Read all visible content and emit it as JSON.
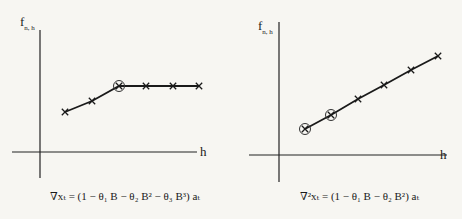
{
  "chart_data": [
    {
      "type": "line",
      "title": "",
      "caption": "∇xₜ = (1 − θ₁ B − θ₂ B² − θ₃ B³) aₜ",
      "xlabel": "h",
      "ylabel": "f_{n,h}",
      "grid": false,
      "x": [
        1,
        2,
        3,
        4,
        5,
        6
      ],
      "values": [
        1.0,
        1.4,
        2.0,
        2.0,
        2.0,
        2.0
      ],
      "markers": [
        "x",
        "x",
        "circled-x",
        "x",
        "x",
        "x"
      ],
      "px": [
        [
          65,
          112
        ],
        [
          92,
          101
        ],
        [
          119,
          86
        ],
        [
          146,
          86
        ],
        [
          173,
          86
        ],
        [
          199,
          86
        ]
      ]
    },
    {
      "type": "line",
      "title": "",
      "caption": "∇²xₜ = (1 − θ₁ B − θ₂ B²) aₜ",
      "xlabel": "h",
      "ylabel": "f_{n,h}",
      "grid": false,
      "x": [
        1,
        2,
        3,
        4,
        5,
        6
      ],
      "values": [
        1.0,
        1.55,
        2.15,
        2.7,
        3.3,
        3.85
      ],
      "markers": [
        "circled-x",
        "circled-x",
        "x",
        "x",
        "x",
        "x"
      ],
      "px": [
        [
          305,
          129
        ],
        [
          331,
          115
        ],
        [
          358,
          99
        ],
        [
          384,
          85
        ],
        [
          411,
          70
        ],
        [
          438,
          56
        ]
      ]
    }
  ],
  "labels": {
    "left": {
      "y_main": "f",
      "y_sub": "n, h",
      "x": "h",
      "caption": "∇xₜ = (1 − θ₁ B − θ₂ B² − θ₃ B³) aₜ"
    },
    "right": {
      "y_main": "f",
      "y_sub": "n, h",
      "x": "h",
      "caption": "∇²xₜ = (1 − θ₁ B − θ₂ B²) aₜ"
    }
  }
}
